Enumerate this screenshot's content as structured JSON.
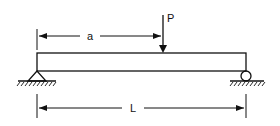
{
  "diagram": {
    "type": "simply-supported-beam",
    "labels": {
      "load": "P",
      "distance_a": "a",
      "span": "L"
    },
    "colors": {
      "stroke": "#111111",
      "background": "#ffffff"
    },
    "supports": {
      "left": "pin",
      "right": "roller"
    }
  }
}
